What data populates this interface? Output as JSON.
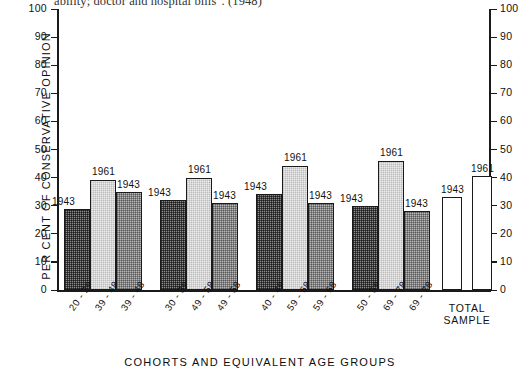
{
  "caption": {
    "text": "ability; doctor and hospital bills\". (1948)"
  },
  "chart_data": {
    "type": "bar",
    "title": "",
    "xlabel": "COHORTS  AND  EQUIVALENT  AGE  GROUPS",
    "ylabel": "PER CENT OF CONSERVATIVE OPINION",
    "ylim": [
      0,
      100
    ],
    "ytick_labels": [
      "100",
      "90",
      "80",
      "70",
      "60",
      "50",
      "40",
      "30",
      "20",
      "10",
      "0"
    ],
    "ytick_values": [
      100,
      90,
      80,
      70,
      60,
      50,
      40,
      30,
      20,
      10,
      0
    ],
    "right_axis": true,
    "right_ytick_labels": [
      "100",
      "90",
      "80",
      "70",
      "60",
      "50",
      "40",
      "30",
      "20",
      "10",
      "0"
    ],
    "grid": false,
    "legend": "none",
    "categories": [
      "20 - 29",
      "39 - 48",
      "39 - 48",
      "30 - 39",
      "49 - 58",
      "49 - 58",
      "40 - 49",
      "59 - 68",
      "59 - 68",
      "50 - 59",
      "69 - 78",
      "69 - 78"
    ],
    "bars": [
      {
        "category": "20 - 29",
        "year": "1943",
        "value": 29,
        "fill": "fill-dark",
        "group": 1
      },
      {
        "category": "39 - 48",
        "year": "1961",
        "value": 39,
        "fill": "fill-light",
        "group": 1
      },
      {
        "category": "39 - 48",
        "year": "1943",
        "value": 35,
        "fill": "fill-mid",
        "group": 1
      },
      {
        "category": "30 - 39",
        "year": "1943",
        "value": 32,
        "fill": "fill-dark",
        "group": 2
      },
      {
        "category": "49 - 58",
        "year": "1961",
        "value": 40,
        "fill": "fill-light",
        "group": 2
      },
      {
        "category": "49 - 58",
        "year": "1943",
        "value": 31,
        "fill": "fill-mid",
        "group": 2
      },
      {
        "category": "40 - 49",
        "year": "1943",
        "value": 34,
        "fill": "fill-dark",
        "group": 3
      },
      {
        "category": "59 - 68",
        "year": "1961",
        "value": 44,
        "fill": "fill-light",
        "group": 3
      },
      {
        "category": "59 - 68",
        "year": "1943",
        "value": 31,
        "fill": "fill-mid",
        "group": 3
      },
      {
        "category": "50 - 59",
        "year": "1943",
        "value": 30,
        "fill": "fill-dark",
        "group": 4
      },
      {
        "category": "69 - 78",
        "year": "1961",
        "value": 46,
        "fill": "fill-light",
        "group": 4
      },
      {
        "category": "69 - 78",
        "year": "1943",
        "value": 28,
        "fill": "fill-mid",
        "group": 4
      }
    ],
    "total_sample": {
      "label_line1": "TOTAL",
      "label_line2": "SAMPLE",
      "bars": [
        {
          "year": "1943",
          "value": 33,
          "fill": "fill-white"
        },
        {
          "year": "1961",
          "value": 40.5,
          "fill": "fill-white"
        }
      ]
    }
  }
}
